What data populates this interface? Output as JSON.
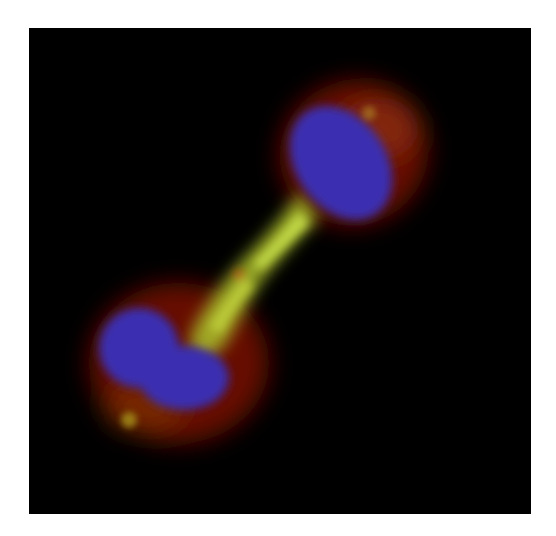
{
  "image": {
    "description": "Fluorescence micrograph of a dividing cell in late telophase / cytokinesis: two blue-stained nuclei connected by a yellow-green microtubule bridge with red cytoplasmic staining",
    "background_color": "#000000",
    "page_color": "#ffffff",
    "channels": [
      {
        "name": "DNA",
        "color": "#3a2fb0"
      },
      {
        "name": "microtubules",
        "color": "#b8d23a"
      },
      {
        "name": "cytoplasm",
        "color": "#8a1a08"
      }
    ]
  }
}
